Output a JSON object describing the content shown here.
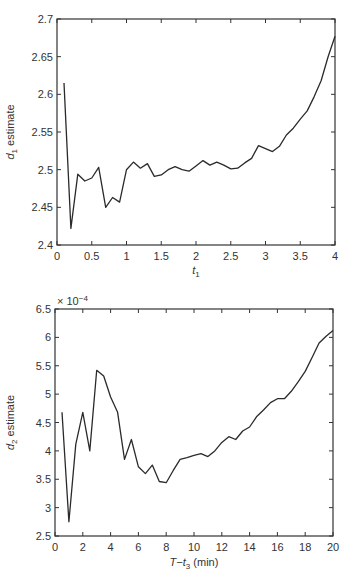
{
  "chart_data": [
    {
      "type": "line",
      "title": "",
      "xlabel": "t1",
      "xlabel_main": "t",
      "xlabel_sub": "1",
      "ylabel": "d1 estimate",
      "ylabel_main": "d",
      "ylabel_sub": "1",
      "ylabel_rest": " estimate",
      "xlim": [
        0,
        4
      ],
      "ylim": [
        2.4,
        2.7
      ],
      "xticks": [
        0,
        0.5,
        1,
        1.5,
        2,
        2.5,
        3,
        3.5,
        4
      ],
      "xtick_labels": [
        "0",
        "0.5",
        "1",
        "1.5",
        "2",
        "2.5",
        "3",
        "3.5",
        "4"
      ],
      "yticks": [
        2.4,
        2.45,
        2.5,
        2.55,
        2.6,
        2.65,
        2.7
      ],
      "ytick_labels": [
        "2.4",
        "2.45",
        "2.5",
        "2.55",
        "2.6",
        "2.65",
        "2.7"
      ],
      "grid": false,
      "legend": null,
      "series": [
        {
          "name": "d1 estimate",
          "x": [
            0.1,
            0.2,
            0.3,
            0.4,
            0.5,
            0.6,
            0.7,
            0.8,
            0.9,
            1.0,
            1.1,
            1.2,
            1.3,
            1.4,
            1.5,
            1.6,
            1.7,
            1.8,
            1.9,
            2.0,
            2.1,
            2.2,
            2.3,
            2.4,
            2.5,
            2.6,
            2.7,
            2.8,
            2.9,
            3.0,
            3.1,
            3.2,
            3.3,
            3.4,
            3.5,
            3.6,
            3.7,
            3.8,
            3.9,
            4.0
          ],
          "values": [
            2.615,
            2.422,
            2.494,
            2.485,
            2.489,
            2.503,
            2.45,
            2.463,
            2.457,
            2.5,
            2.51,
            2.502,
            2.508,
            2.491,
            2.493,
            2.5,
            2.504,
            2.5,
            2.498,
            2.505,
            2.512,
            2.506,
            2.51,
            2.506,
            2.501,
            2.502,
            2.509,
            2.515,
            2.532,
            2.528,
            2.524,
            2.531,
            2.546,
            2.555,
            2.567,
            2.578,
            2.597,
            2.618,
            2.65,
            2.677
          ]
        }
      ]
    },
    {
      "type": "line",
      "title": "",
      "xlabel": "T-t3 (min)",
      "xlabel_main": "T−t",
      "xlabel_sub": "3",
      "xlabel_rest": "  (min)",
      "ylabel": "d2 estimate",
      "ylabel_main": "d",
      "ylabel_sub": "2",
      "ylabel_rest": " estimate",
      "y_multiplier": "× 10",
      "y_multiplier_exp": "−4",
      "xlim": [
        0,
        20
      ],
      "ylim": [
        2.5,
        6.5
      ],
      "xticks": [
        0,
        2,
        4,
        6,
        8,
        10,
        12,
        14,
        16,
        18,
        20
      ],
      "xtick_labels": [
        "0",
        "2",
        "4",
        "6",
        "8",
        "10",
        "12",
        "14",
        "16",
        "18",
        "20"
      ],
      "yticks": [
        2.5,
        3,
        3.5,
        4,
        4.5,
        5,
        5.5,
        6,
        6.5
      ],
      "ytick_labels": [
        "2.5",
        "3",
        "3.5",
        "4",
        "4.5",
        "5",
        "5.5",
        "6",
        "6.5"
      ],
      "grid": false,
      "legend": null,
      "series": [
        {
          "name": "d2 estimate (×10^-4)",
          "x": [
            0.5,
            1,
            1.5,
            2,
            2.5,
            3,
            3.5,
            4,
            4.5,
            5,
            5.5,
            6,
            6.5,
            7,
            7.5,
            8,
            8.5,
            9,
            9.5,
            10,
            10.5,
            11,
            11.5,
            12,
            12.5,
            13,
            13.5,
            14,
            14.5,
            15,
            15.5,
            16,
            16.5,
            17,
            17.5,
            18,
            18.5,
            19,
            19.5,
            20
          ],
          "values": [
            4.68,
            2.75,
            4.12,
            4.68,
            4.0,
            5.42,
            5.32,
            4.95,
            4.68,
            3.85,
            4.2,
            3.72,
            3.6,
            3.75,
            3.46,
            3.44,
            3.65,
            3.85,
            3.88,
            3.92,
            3.95,
            3.9,
            4.0,
            4.15,
            4.25,
            4.2,
            4.35,
            4.42,
            4.6,
            4.72,
            4.85,
            4.92,
            4.92,
            5.05,
            5.22,
            5.4,
            5.65,
            5.9,
            6.02,
            6.12
          ]
        }
      ]
    }
  ],
  "colors": {
    "line": "#2a2a2a",
    "axis": "#333333",
    "background": "#ffffff"
  }
}
